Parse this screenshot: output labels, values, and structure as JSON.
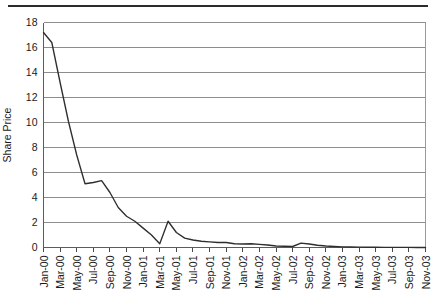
{
  "figure": {
    "title": "",
    "top_rule": true,
    "background_color": "#ffffff",
    "line_color": "#2e2e2e",
    "grid_color": "#8d8d8d"
  },
  "chart_data": {
    "type": "line",
    "title": "",
    "subtitle": "",
    "xlabel": "",
    "ylabel": "Share Price",
    "ylim": [
      0,
      18
    ],
    "ytick_labels": [
      "0",
      "2",
      "4",
      "6",
      "8",
      "10",
      "12",
      "14",
      "16",
      "18"
    ],
    "ytick_values": [
      0,
      2,
      4,
      6,
      8,
      10,
      12,
      14,
      16,
      18
    ],
    "grid": true,
    "grid_axis": "y",
    "legend": false,
    "legend_position": "none",
    "xtick_labels": [
      "Jan-00",
      "Mar-00",
      "May-00",
      "Jul-00",
      "Sep-00",
      "Nov-00",
      "Jan-01",
      "Mar-01",
      "May-01",
      "Jul-01",
      "Sep-01",
      "Nov-01",
      "Jan-02",
      "Mar-02",
      "May-02",
      "Jul-02",
      "Sep-02",
      "Nov-02",
      "Jan-03",
      "Mar-03",
      "May-03",
      "Jul-03",
      "Sep-03",
      "Nov-03"
    ],
    "xtick_rotation": 90,
    "x_categories": [
      "Jan-00",
      "Feb-00",
      "Mar-00",
      "Apr-00",
      "May-00",
      "Jun-00",
      "Jul-00",
      "Aug-00",
      "Sep-00",
      "Oct-00",
      "Nov-00",
      "Dec-00",
      "Jan-01",
      "Feb-01",
      "Mar-01",
      "Apr-01",
      "May-01",
      "Jun-01",
      "Jul-01",
      "Aug-01",
      "Sep-01",
      "Oct-01",
      "Nov-01",
      "Dec-01",
      "Jan-02",
      "Feb-02",
      "Mar-02",
      "Apr-02",
      "May-02",
      "Jun-02",
      "Jul-02",
      "Aug-02",
      "Sep-02",
      "Oct-02",
      "Nov-02",
      "Dec-02",
      "Jan-03",
      "Feb-03",
      "Mar-03",
      "Apr-03",
      "May-03",
      "Jun-03",
      "Jul-03",
      "Aug-03",
      "Sep-03",
      "Oct-03",
      "Nov-03"
    ],
    "series": [
      {
        "name": "Share Price",
        "values": [
          17.2,
          16.4,
          13.2,
          10.1,
          7.4,
          5.1,
          5.2,
          5.35,
          4.4,
          3.2,
          2.5,
          2.1,
          1.55,
          1.0,
          0.3,
          2.1,
          1.2,
          0.75,
          0.6,
          0.5,
          0.45,
          0.4,
          0.4,
          0.3,
          0.28,
          0.3,
          0.25,
          0.2,
          0.12,
          0.1,
          0.08,
          0.35,
          0.28,
          0.18,
          0.12,
          0.08,
          0.05,
          0.04,
          0.03,
          0.02,
          0.02,
          0.01,
          0.01,
          0.01,
          0.01,
          0.0,
          0.0
        ]
      }
    ]
  }
}
